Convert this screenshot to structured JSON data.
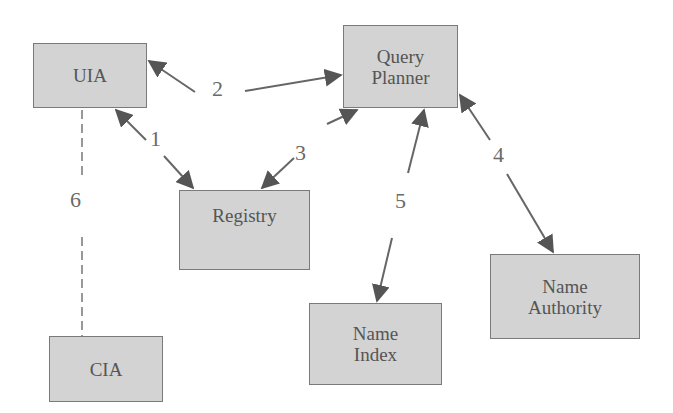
{
  "diagram": {
    "nodes": {
      "uia": {
        "label": "UIA"
      },
      "query_planner": {
        "line1": "Query",
        "line2": "Planner"
      },
      "registry": {
        "label": "Registry"
      },
      "cia": {
        "label": "CIA"
      },
      "name_index": {
        "line1": "Name",
        "line2": "Index"
      },
      "name_authority": {
        "line1": "Name",
        "line2": "Authority"
      }
    },
    "edges": [
      {
        "id": "1",
        "from": "UIA",
        "to": "Registry",
        "label": "1",
        "style": "bidirectional"
      },
      {
        "id": "2",
        "from": "UIA",
        "to": "Query Planner",
        "label": "2",
        "style": "bidirectional"
      },
      {
        "id": "3",
        "from": "Registry",
        "to": "Query Planner",
        "label": "3",
        "style": "bidirectional"
      },
      {
        "id": "4",
        "from": "Query Planner",
        "to": "Name Authority",
        "label": "4",
        "style": "bidirectional"
      },
      {
        "id": "5",
        "from": "Query Planner",
        "to": "Name Index",
        "label": "5",
        "style": "bidirectional"
      },
      {
        "id": "6",
        "from": "UIA",
        "to": "CIA",
        "label": "6",
        "style": "dashed"
      }
    ],
    "colors": {
      "node_fill": "#d3d3d3",
      "node_border": "#7a7a7a",
      "edge": "#555555",
      "text": "#555555"
    }
  }
}
